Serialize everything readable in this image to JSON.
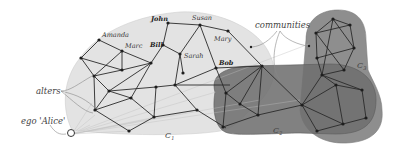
{
  "diagram": {
    "annotations": {
      "communities": "communities",
      "alters": "alters",
      "ego": "ego 'Alice'"
    },
    "communities": [
      {
        "id": "C1",
        "label": "C",
        "sub": "1",
        "fill": "#e3e3e3"
      },
      {
        "id": "C2",
        "label": "C",
        "sub": "2",
        "fill": "#6f6f6f"
      },
      {
        "id": "C3",
        "label": "C",
        "sub": "3",
        "fill": "#8e8e8e"
      }
    ],
    "named_alters": [
      {
        "name": "Amanda",
        "bold": false
      },
      {
        "name": "Marc",
        "bold": false
      },
      {
        "name": "John",
        "bold": true
      },
      {
        "name": "Bill",
        "bold": true
      },
      {
        "name": "Susan",
        "bold": false
      },
      {
        "name": "Sarah",
        "bold": false
      },
      {
        "name": "Mary",
        "bold": false
      },
      {
        "name": "Bob",
        "bold": true
      }
    ],
    "colors": {
      "edge": "#2a2a2a",
      "node": "#1e1e1e",
      "c1_fill": "#e3e3e3",
      "c2_fill": "#6f6f6f",
      "c3_fill": "#8e8e8e"
    }
  }
}
